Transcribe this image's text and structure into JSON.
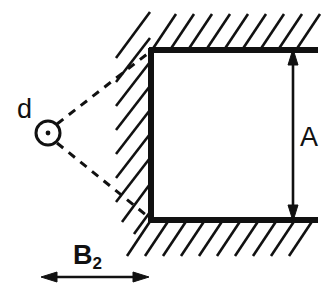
{
  "figure": {
    "background_color": "#ffffff",
    "ink_color": "#111111",
    "width": 335,
    "height": 297
  },
  "labels": {
    "source": "d",
    "height_dimension": "A",
    "distance_dimension_base": "B",
    "distance_dimension_sub": "2"
  },
  "elements": {
    "source_marker": {
      "name": "circle-with-center-dot",
      "center_x": 48,
      "center_y": 133,
      "radius": 12
    },
    "cavity": {
      "left_wall_x": 151,
      "top_wall_y": 50,
      "bottom_wall_y": 220,
      "wall_right_end_x": 318,
      "open_side": "right"
    },
    "dashed_rays": [
      {
        "name": "upper-ray",
        "from_x": 58,
        "from_y": 124,
        "to_x": 151,
        "to_y": 51
      },
      {
        "name": "lower-ray",
        "from_x": 58,
        "from_y": 143,
        "to_x": 151,
        "to_y": 219
      }
    ],
    "dimension_A": {
      "x": 293,
      "top_y": 52,
      "bottom_y": 218,
      "arrowheads": "both"
    },
    "dimension_B2": {
      "y": 277,
      "left_x": 42,
      "right_x": 148,
      "arrowheads": "both"
    },
    "hatching": {
      "top_count": 9,
      "bottom_count": 10,
      "left_count": 9,
      "angle_deg": 45
    }
  }
}
